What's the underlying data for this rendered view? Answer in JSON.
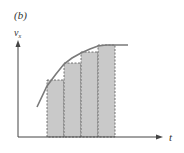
{
  "figure": {
    "panel_label": "(b)",
    "y_axis_label": "v",
    "y_axis_subscript": "x",
    "x_axis_label": "t"
  },
  "colors": {
    "background": "#ffffff",
    "bar_fill": "#c9c9c9",
    "bar_border": "#555555",
    "curve": "#7a7a7a",
    "axis": "#444444",
    "text": "#333333"
  },
  "bars": [
    {
      "x0": 47,
      "x1": 64,
      "top": 80
    },
    {
      "x0": 64,
      "x1": 81,
      "top": 63
    },
    {
      "x0": 81,
      "x1": 98,
      "top": 52
    },
    {
      "x0": 98,
      "x1": 115,
      "top": 45
    }
  ],
  "axes": {
    "origin": [
      18,
      137
    ],
    "y_end": 40,
    "x_end": 163
  },
  "curve": {
    "description": "increasing concave curve leveling off to horizontal",
    "points": [
      [
        37,
        107
      ],
      [
        47,
        86
      ],
      [
        56,
        74
      ],
      [
        64,
        64
      ],
      [
        72,
        58
      ],
      [
        81,
        53
      ],
      [
        90,
        49
      ],
      [
        98,
        46
      ],
      [
        106,
        45
      ],
      [
        115,
        45
      ],
      [
        128,
        45
      ]
    ]
  }
}
